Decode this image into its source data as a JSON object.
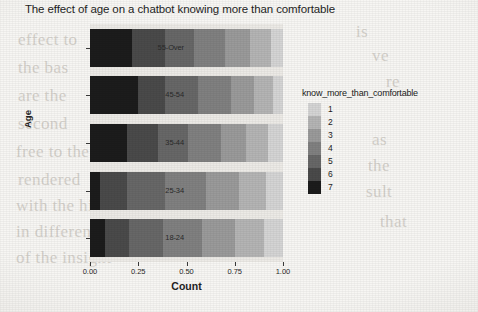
{
  "chart_data": {
    "type": "bar",
    "orientation": "horizontal",
    "stacked": true,
    "normalized": true,
    "title": "The effect of age on a chatbot knowing more than comfortable",
    "xlabel": "Count",
    "ylabel": "Age",
    "xlim": [
      0,
      1
    ],
    "xticks": [
      "0.00",
      "0.25",
      "0.50",
      "0.75",
      "1.00"
    ],
    "xtick_values": [
      0,
      0.25,
      0.5,
      0.75,
      1
    ],
    "categories": [
      "18-24",
      "25-34",
      "35-44",
      "45-54",
      "55-Over"
    ],
    "category_order_top_to_bottom": [
      "55-Over",
      "45-54",
      "35-44",
      "25-34",
      "18-24"
    ],
    "grid": false,
    "legend": {
      "title": "know_more_than_comfortable",
      "position": "right",
      "entries": [
        {
          "label": "1",
          "color": "#d4d4d4"
        },
        {
          "label": "2",
          "color": "#b4b4b4"
        },
        {
          "label": "3",
          "color": "#9a9a9a"
        },
        {
          "label": "4",
          "color": "#808080"
        },
        {
          "label": "5",
          "color": "#676767"
        },
        {
          "label": "6",
          "color": "#4a4a4a"
        },
        {
          "label": "7",
          "color": "#1c1c1c"
        }
      ]
    },
    "series": [
      {
        "name": "7",
        "color": "#1c1c1c",
        "values": [
          0.08,
          0.05,
          0.19,
          0.25,
          0.22
        ]
      },
      {
        "name": "6",
        "color": "#4a4a4a",
        "values": [
          0.12,
          0.14,
          0.16,
          0.14,
          0.17
        ]
      },
      {
        "name": "5",
        "color": "#676767",
        "values": [
          0.18,
          0.2,
          0.16,
          0.17,
          0.15
        ]
      },
      {
        "name": "4",
        "color": "#808080",
        "values": [
          0.2,
          0.21,
          0.17,
          0.17,
          0.16
        ]
      },
      {
        "name": "3",
        "color": "#9a9a9a",
        "values": [
          0.17,
          0.17,
          0.13,
          0.12,
          0.13
        ]
      },
      {
        "name": "2",
        "color": "#b4b4b4",
        "values": [
          0.15,
          0.14,
          0.11,
          0.1,
          0.11
        ]
      },
      {
        "name": "1",
        "color": "#d4d4d4",
        "values": [
          0.1,
          0.09,
          0.08,
          0.05,
          0.06
        ]
      }
    ],
    "panel_background": "#eceae6"
  },
  "page_bleed": {
    "lines": [
      {
        "text": "effect to",
        "x": 18,
        "y": 30
      },
      {
        "text": "the bas",
        "x": 18,
        "y": 58
      },
      {
        "text": "are the",
        "x": 18,
        "y": 86
      },
      {
        "text": "second",
        "x": 18,
        "y": 114
      },
      {
        "text": "free to the",
        "x": 16,
        "y": 142
      },
      {
        "text": "rendered",
        "x": 18,
        "y": 170
      },
      {
        "text": "with the high",
        "x": 16,
        "y": 196
      },
      {
        "text": "in differences",
        "x": 16,
        "y": 222
      },
      {
        "text": "of the insight",
        "x": 16,
        "y": 248
      },
      {
        "text": "is",
        "x": 356,
        "y": 22
      },
      {
        "text": "ve",
        "x": 372,
        "y": 46
      },
      {
        "text": "re",
        "x": 386,
        "y": 72
      },
      {
        "text": "as",
        "x": 372,
        "y": 130
      },
      {
        "text": "the",
        "x": 368,
        "y": 156
      },
      {
        "text": "sult",
        "x": 366,
        "y": 182
      },
      {
        "text": "that",
        "x": 380,
        "y": 212
      }
    ]
  }
}
